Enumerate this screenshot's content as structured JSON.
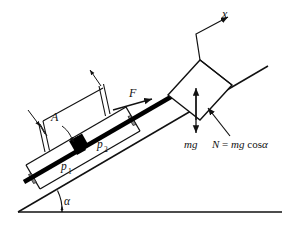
{
  "figure": {
    "background_color": "#ffffff",
    "line_color": "#111111",
    "incline_angle_deg": 24
  },
  "labels": {
    "axis_x": "x",
    "force_F": "F",
    "area_A": "A",
    "pressure_1": "p",
    "pressure_1_sub": "1",
    "pressure_2": "p",
    "pressure_2_sub": "2",
    "weight": "mg",
    "normal_prefix": "N",
    "normal_equals": " = ",
    "normal_value": "mg",
    "normal_cos": " cos",
    "normal_alpha": "α",
    "angle_alpha": "α"
  },
  "elements": {
    "ground_line": "horizontal-ground",
    "incline_surface": "incline-surface",
    "cylinder_body": "cylinder-housing",
    "piston": "piston-slab",
    "rod": "piston-rod",
    "block": "block-mass",
    "arrow_F": "force-arrow-F",
    "arrow_mg": "weight-arrow",
    "arrow_N": "normal-force-arrow",
    "arrow_x": "x-axis-arrow",
    "dimension_A": "area-dimension-A",
    "angle_arc": "alpha-angle-arc"
  },
  "colors": {
    "stroke": "#111111",
    "fill_solid": "#000000",
    "hatch": "#8a8a8a",
    "paper": "#ffffff"
  }
}
